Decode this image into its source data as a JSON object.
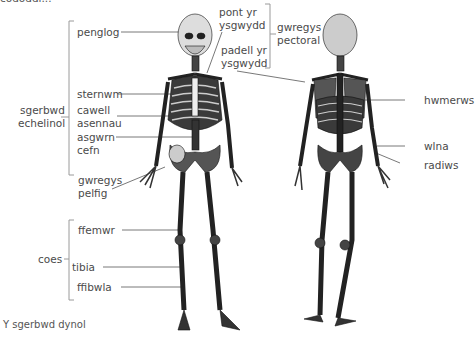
{
  "diagram": {
    "title_fragment": "cododdi...",
    "caption": "Y sgerbwd dynol",
    "views": [
      "front",
      "back"
    ],
    "labels": {
      "penglog": "penglog",
      "sternwm": "sternwm",
      "cawell_1": "cawell",
      "cawell_2": "asennau",
      "asgwrn_1": "asgwrn",
      "asgwrn_2": "cefn",
      "gwregys_pelfig_1": "gwregys",
      "gwregys_pelfig_2": "pelfig",
      "ffemwr": "ffemwr",
      "tibia": "tibia",
      "ffibwla": "ffibwla",
      "pont_1": "pont yr",
      "pont_2": "ysgwydd",
      "padell_1": "padell yr",
      "padell_2": "ysgwydd",
      "gwregys_pectoral_1": "gwregys",
      "gwregys_pectoral_2": "pectoral",
      "hwmerws": "hwmerws",
      "wlna": "wlna",
      "radiws": "radiws"
    },
    "groups": {
      "sgerbwd_1": "sgerbwd",
      "sgerbwd_2": "echelinol",
      "coes": "coes"
    },
    "colors": {
      "text": "#4a4a4a",
      "leader_line": "#555555",
      "bracket": "#9a9a9a",
      "bone_dark": "#1a1a1a",
      "bone_light": "#e8e8e8"
    }
  }
}
